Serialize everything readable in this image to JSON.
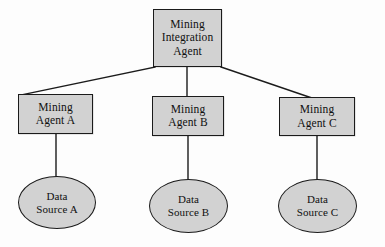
{
  "diagram": {
    "background_color": "#fdfdfd",
    "shape_fill_color": "#d2d2d2",
    "shape_border_color": "#1b1b1b",
    "edge_color": "#1b1b1b",
    "nodes": {
      "integration_agent": {
        "shape": "rectangle",
        "line1": "Mining",
        "line2": "Integration",
        "line3": "Agent"
      },
      "agent_a": {
        "shape": "rectangle",
        "line1": "Mining",
        "line2": "Agent A"
      },
      "agent_b": {
        "shape": "rectangle",
        "line1": "Mining",
        "line2": "Agent B"
      },
      "agent_c": {
        "shape": "rectangle",
        "line1": "Mining",
        "line2": "Agent C"
      },
      "source_a": {
        "shape": "ellipse",
        "line1": "Data",
        "line2": "Source A"
      },
      "source_b": {
        "shape": "ellipse",
        "line1": "Data",
        "line2": "Source B"
      },
      "source_c": {
        "shape": "ellipse",
        "line1": "Data",
        "line2": "Source C"
      }
    },
    "edges": [
      {
        "from": "integration_agent",
        "to": "agent_a",
        "style": "solid-diagonal"
      },
      {
        "from": "integration_agent",
        "to": "agent_b",
        "style": "solid-vertical"
      },
      {
        "from": "integration_agent",
        "to": "agent_c",
        "style": "solid-diagonal"
      },
      {
        "from": "agent_a",
        "to": "source_a",
        "style": "solid-vertical"
      },
      {
        "from": "agent_b",
        "to": "source_b",
        "style": "solid-vertical"
      },
      {
        "from": "agent_c",
        "to": "source_c",
        "style": "solid-vertical"
      }
    ]
  }
}
